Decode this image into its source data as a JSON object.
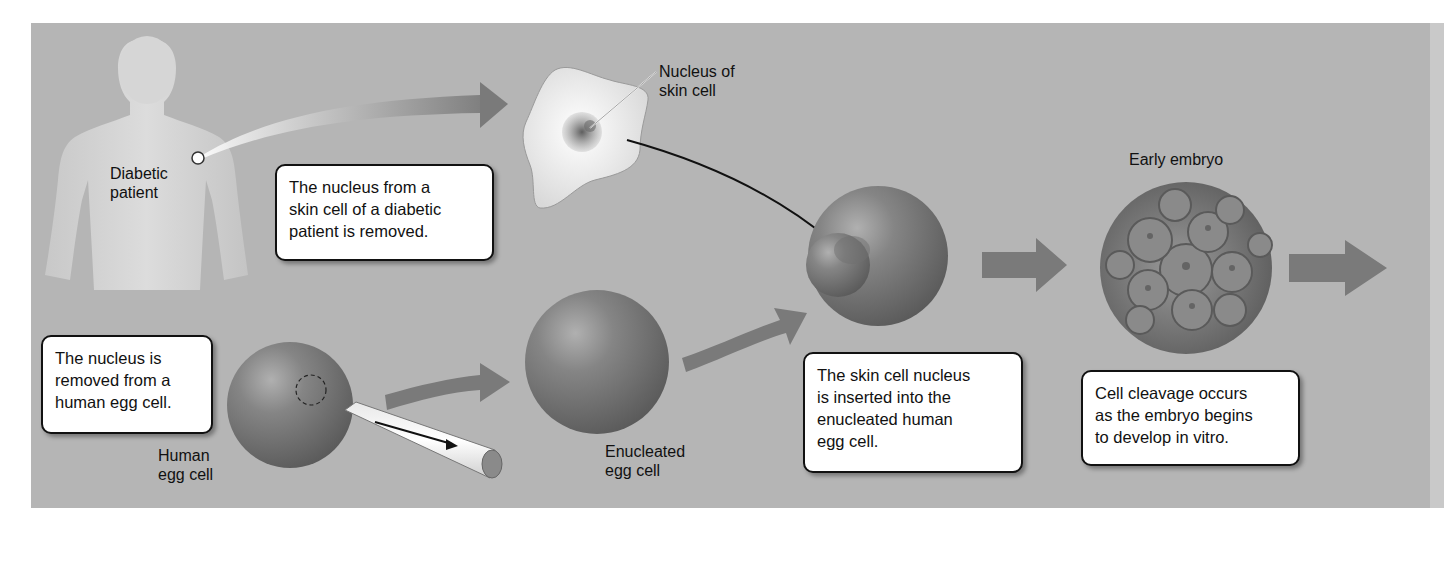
{
  "figure": {
    "background_color": "#b5b5b5",
    "arrow_color": "#7a7a7a",
    "labels": {
      "diabetic_patient": "Diabetic\npatient",
      "nucleus_of_skin_cell": "Nucleus of\nskin cell",
      "early_embryo": "Early embryo",
      "human_egg_cell": "Human\negg cell",
      "enucleated_egg_cell": "Enucleated\negg cell"
    },
    "captions": {
      "step1": "The nucleus from a\nskin cell of a diabetic\npatient is removed.",
      "step2": "The nucleus is\nremoved from a\nhuman egg cell.",
      "step3": "The skin cell nucleus\nis inserted into the\nenucleated human\negg cell.",
      "step4": "Cell cleavage occurs\nas the embryo begins\nto develop in vitro."
    }
  }
}
